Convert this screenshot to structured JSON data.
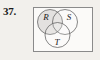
{
  "figure": {
    "number_label": "37.",
    "type": "venn-diagram",
    "background_color": "#f2f0ec",
    "universal_set": {
      "shape": "rectangle",
      "border_color": "#8a8a8a",
      "fill_color": "#fbfaf8",
      "x": 33,
      "y": 7,
      "width": 60,
      "height": 45
    },
    "circles": [
      {
        "label": "R",
        "name": "set-r",
        "cx": 50,
        "cy": 22,
        "r": 12.5,
        "fill_color": "#dedcda",
        "stroke_color": "#555555",
        "label_x": 46,
        "label_y": 19
      },
      {
        "label": "S",
        "name": "set-s",
        "cx": 65,
        "cy": 22,
        "r": 12.5,
        "fill_color": "none",
        "stroke_color": "#555555",
        "label_x": 69,
        "label_y": 19
      },
      {
        "label": "T",
        "name": "set-t",
        "cx": 57.5,
        "cy": 35,
        "r": 12.5,
        "fill_color": "none",
        "stroke_color": "#555555",
        "label_x": 56,
        "label_y": 44
      }
    ]
  }
}
